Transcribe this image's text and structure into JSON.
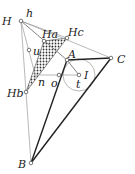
{
  "diagram": {
    "title": "",
    "points": {
      "H": {
        "label": "H",
        "x": 21,
        "y": 21,
        "lx": 2,
        "ly": 25
      },
      "h": {
        "label": "h",
        "x": 21,
        "y": 21,
        "lx": 26,
        "ly": 17
      },
      "Ha": {
        "label": "Ha",
        "x": 44,
        "y": 41,
        "lx": 42,
        "ly": 38
      },
      "Hc": {
        "label": "Hc",
        "x": 67,
        "y": 38,
        "lx": 68,
        "ly": 36
      },
      "A": {
        "label": "A",
        "x": 67,
        "y": 60,
        "lx": 68,
        "ly": 58
      },
      "C": {
        "label": "C",
        "x": 111,
        "y": 58,
        "lx": 117,
        "ly": 63
      },
      "u": {
        "label": "u",
        "x": 29,
        "y": 50,
        "lx": 33,
        "ly": 55
      },
      "I": {
        "label": "I",
        "x": 79,
        "y": 75,
        "lx": 84,
        "ly": 79
      },
      "t": {
        "label": "t",
        "x": 79,
        "y": 75,
        "lx": 76,
        "ly": 88
      },
      "o": {
        "label": "o",
        "x": 59,
        "y": 75,
        "lx": 51,
        "ly": 87
      },
      "n": {
        "label": "n",
        "x": 36,
        "y": 78,
        "lx": 38,
        "ly": 86
      },
      "Hb": {
        "label": "Hb",
        "x": 26,
        "y": 92,
        "lx": 7,
        "ly": 97
      },
      "B": {
        "label": "B",
        "x": 31,
        "y": 163,
        "lx": 18,
        "ly": 168
      }
    },
    "incircle": {
      "cx": 79,
      "cy": 75,
      "r": 16
    },
    "shaded_triangle": [
      "Ha",
      "Hc",
      "Hb"
    ],
    "thick_edges": [
      [
        "A",
        "B"
      ],
      [
        "A",
        "C"
      ],
      [
        "B",
        "C"
      ]
    ],
    "thin_edges": [
      [
        "H",
        "C"
      ],
      [
        "H",
        "B"
      ],
      [
        "H",
        "A"
      ],
      [
        "Ha",
        "Hb"
      ],
      [
        "o",
        "I"
      ],
      [
        "A",
        "I"
      ],
      [
        "u",
        "Hb"
      ]
    ],
    "colors": {
      "ink": "#222222",
      "thin_line": "#9a9a9a",
      "shade": "#333333"
    }
  }
}
